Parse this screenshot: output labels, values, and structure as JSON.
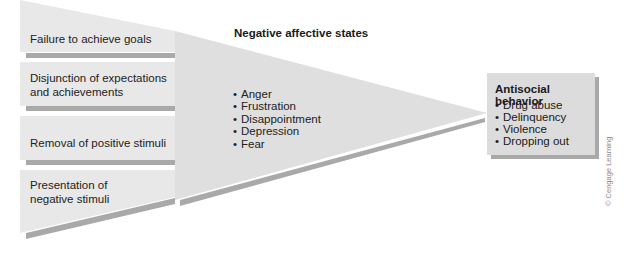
{
  "diagram": {
    "type": "general strain theory flow diagram",
    "sources_of_strain": [
      {
        "label_line1": "Failure to achieve goals",
        "label_line2": ""
      },
      {
        "label_line1": "Disjunction of expectations",
        "label_line2": "and achievements"
      },
      {
        "label_line1": "Removal of positive stimuli",
        "label_line2": ""
      },
      {
        "label_line1": "Presentation of",
        "label_line2": "negative stimuli"
      }
    ],
    "affective_states": {
      "title": "Negative affective states",
      "items": [
        "Anger",
        "Frustration",
        "Disappointment",
        "Depression",
        "Fear"
      ]
    },
    "outcome": {
      "title": "Antisocial behavior",
      "items": [
        "Drug abuse",
        "Delinquency",
        "Violence",
        "Dropping out"
      ]
    },
    "credit": "© Cengage Learning",
    "colors": {
      "box_fill": "#e6e6e6",
      "triangle_fill": "#dedede",
      "shadow": "#a8a8a8",
      "outcome_fill": "#dcdcdc"
    }
  }
}
